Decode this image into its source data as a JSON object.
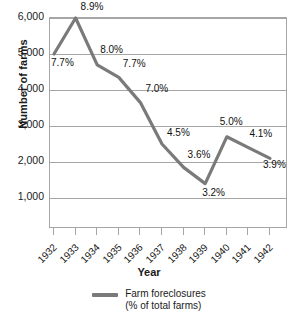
{
  "chart_data": {
    "type": "line",
    "title": "",
    "xlabel": "Year",
    "ylabel": "Number of farms",
    "categories": [
      "1932",
      "1933",
      "1934",
      "1935",
      "1936",
      "1937",
      "1938",
      "1939",
      "1940",
      "1941",
      "1942"
    ],
    "series": [
      {
        "name": "Farm foreclosures (% of total farms)",
        "color": "#7a7a7a",
        "values": [
          5000,
          6000,
          4700,
          4350,
          3650,
          2500,
          1850,
          1400,
          2700,
          2400,
          2100
        ],
        "point_labels": [
          "7.7%",
          "8.9%",
          "8.0%",
          "7.7%",
          "7.0%",
          "4.5%",
          "3.6%",
          "3.2%",
          "5.0%",
          "4.1%",
          "3.9%"
        ]
      }
    ],
    "ylim": [
      0,
      6000
    ],
    "yticks": [
      6000,
      5000,
      4000,
      3000,
      2000,
      1000
    ],
    "ytick_labels": [
      "6,000",
      "5,000",
      "4,000",
      "3,000",
      "2,000",
      "1,000"
    ],
    "grid": "horizontal",
    "legend_position": "bottom"
  },
  "legend": {
    "line1": "Farm foreclosures",
    "line2": "(% of total farms)"
  },
  "axes": {
    "y_title": "Number of farms",
    "x_title": "Year"
  }
}
